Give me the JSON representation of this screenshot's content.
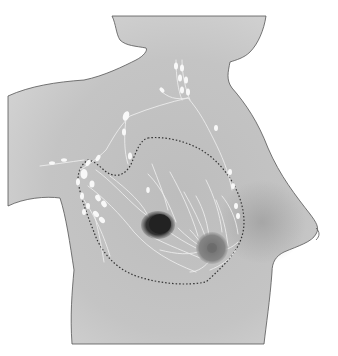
{
  "illustration": {
    "subject": "breast lymphatic drainage anatomy",
    "view": "lateral torso",
    "colors": {
      "background": "#ffffff",
      "skin_light": "#c9c9c9",
      "skin_dark": "#9a9a9a",
      "outline": "#555555",
      "lymph": "#f4f4f4",
      "tumor": "#2a2a2a",
      "areola": "#7a7a7a",
      "dotted_boundary": "#333333"
    },
    "elements": [
      {
        "name": "torso-silhouette"
      },
      {
        "name": "breast-tissue-boundary",
        "style": "dotted"
      },
      {
        "name": "tumor",
        "shade": "dark"
      },
      {
        "name": "areola"
      },
      {
        "name": "nipple"
      },
      {
        "name": "axillary-lymph-nodes"
      },
      {
        "name": "supraclavicular-lymph-nodes"
      },
      {
        "name": "internal-mammary-lymph-nodes"
      },
      {
        "name": "lymphatic-vessels"
      }
    ]
  }
}
